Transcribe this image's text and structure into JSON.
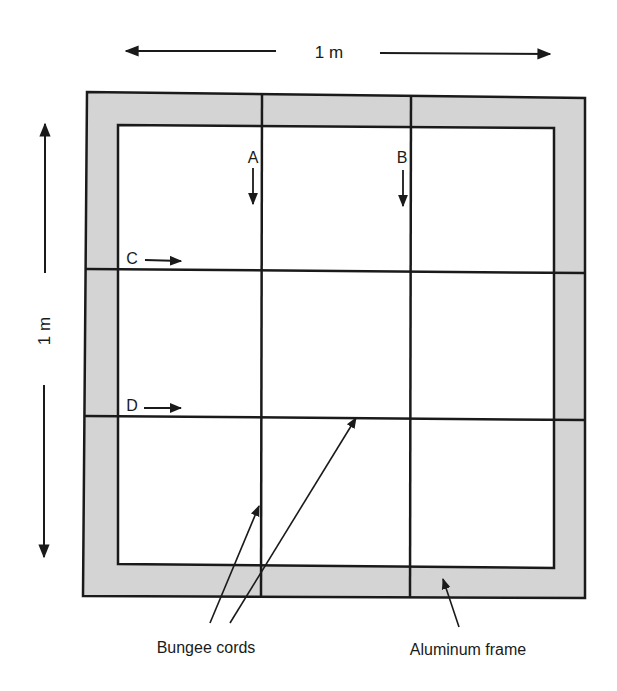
{
  "diagram": {
    "type": "mechanical-schematic",
    "dimensions": {
      "width_label": "1 m",
      "height_label": "1 m"
    },
    "cord_labels": {
      "A": "A",
      "B": "B",
      "C": "C",
      "D": "D"
    },
    "callouts": {
      "bungee": "Bungee cords",
      "frame": "Aluminum frame"
    },
    "colors": {
      "frame_fill": "#d4d4d4",
      "line": "#1a1a1a",
      "background": "#ffffff"
    },
    "nodes": [
      {
        "id": "frame",
        "label": "Aluminum frame"
      },
      {
        "id": "cord-A",
        "label": "A",
        "orientation": "vertical",
        "arrow": "down"
      },
      {
        "id": "cord-B",
        "label": "B",
        "orientation": "vertical",
        "arrow": "down"
      },
      {
        "id": "cord-C",
        "label": "C",
        "orientation": "horizontal",
        "arrow": "right"
      },
      {
        "id": "cord-D",
        "label": "D",
        "orientation": "horizontal",
        "arrow": "right"
      }
    ]
  }
}
